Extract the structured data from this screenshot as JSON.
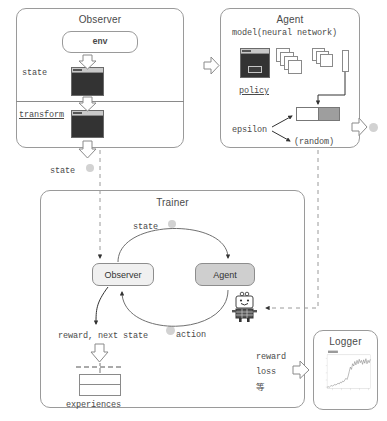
{
  "diagram": {
    "type": "block-flow-diagram"
  },
  "observer_box": {
    "title": "Observer",
    "env_label": "env",
    "state_label": "state",
    "transform_label": "transform",
    "output_state_label": "state"
  },
  "agent_box": {
    "title": "Agent",
    "model_label": "model(neural network)",
    "policy_label": "policy",
    "epsilon_label": "epsilon",
    "random_label": "(random)"
  },
  "trainer_box": {
    "title": "Trainer",
    "observer_node": "Observer",
    "agent_node": "Agent",
    "state_label": "state",
    "action_label": "action",
    "reward_next_state_label": "reward, next state",
    "experiences_label": "experiences",
    "reward_out": "reward",
    "loss_out": "loss",
    "etc_out": "等"
  },
  "logger_box": {
    "title": "Logger",
    "chart": {
      "type": "line",
      "title": "",
      "xlabel": "",
      "ylabel": "",
      "legend": [
        "reward"
      ],
      "x": [
        0,
        1,
        2,
        3,
        4,
        5,
        6,
        7,
        8,
        9,
        10,
        11,
        12,
        13,
        14,
        15,
        16,
        17,
        18,
        19,
        20,
        21,
        22,
        23,
        24,
        25,
        26,
        27,
        28,
        29,
        30,
        31,
        32,
        33,
        34,
        35,
        36,
        37,
        38,
        39
      ],
      "values": [
        2,
        3,
        2,
        4,
        5,
        4,
        6,
        7,
        6,
        8,
        9,
        8,
        11,
        10,
        13,
        12,
        15,
        18,
        16,
        22,
        30,
        38,
        34,
        44,
        40,
        48,
        42,
        50,
        44,
        52,
        46,
        50,
        43,
        51,
        45,
        53,
        44,
        50,
        46,
        52
      ],
      "ylim": [
        0,
        60
      ],
      "xlim": [
        0,
        40
      ]
    }
  },
  "colors": {
    "border": "#9a9a9a",
    "text": "#4a4a4a",
    "agent_fill": "#cfcfcf",
    "observer_fill": "#f0f0f0",
    "state_fill": "#3a3a3a",
    "dot": "#d2d2d2",
    "arrow_outline": "#8a8a8a"
  }
}
